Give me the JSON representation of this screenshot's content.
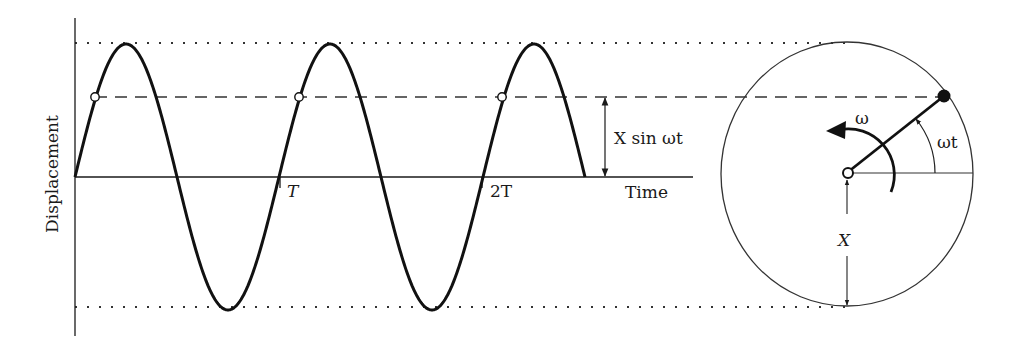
{
  "diagram": {
    "type": "simple-harmonic-motion-phasor",
    "colors": {
      "line": "#1a1a1a",
      "guide": "#333333",
      "background": "#ffffff"
    },
    "waveform": {
      "y_axis_label": "Displacement",
      "x_axis_label": "Time",
      "tick_labels": [
        "T",
        "2T"
      ],
      "amplitude_label": "X sin ωt",
      "cycles_shown": 2.5
    },
    "phasor": {
      "angular_velocity_label": "ω",
      "angle_label": "ωt",
      "radius_label": "X"
    }
  }
}
